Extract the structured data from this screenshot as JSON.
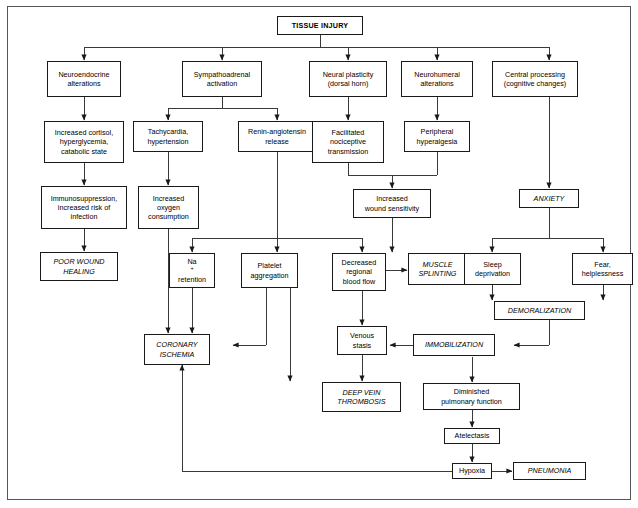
{
  "figure": {
    "type": "flowchart",
    "title": "TISSUE INJURY",
    "border_color": "#555555",
    "node_border_color": "#1a1a1a",
    "background": "#ffffff"
  },
  "nodes": {
    "tissue_injury": "TISSUE INJURY",
    "neuroendocrine_alterations": "Neuroendocrine\nalterations",
    "sympathoadrenal_activation": "Sympathoadrenal\nactivation",
    "neural_plasticity": "Neural plasticity\n(dorsal horn)",
    "neurohumeral_alterations": "Neurohumeral\nalterations",
    "central_processing": "Central processing\n(cognitive changes)",
    "increased_cortisol": "Increased cortisol,\nhyperglycemia,\ncatabolic state",
    "tachycardia": "Tachycardia,\nhypertension",
    "renin_angiotensin": "Renin-angiotensin\nrelease",
    "facilitated_nociceptive": "Facilitated\nnociceptive\ntransmission",
    "peripheral_hyperalgesia": "Peripheral\nhyperalgesia",
    "immunosuppression": "Immunosuppression,\nincreased risk of\ninfection",
    "increased_oxygen": "Increased\noxygen\nconsumption",
    "increased_wound_sensitivity": "Increased\nwound sensitivity",
    "anxiety": "ANXIETY",
    "poor_wound_healing": "POOR WOUND\nHEALING",
    "na_retention_line1": "Na",
    "na_retention_sup": "+",
    "na_retention_line2": "retention",
    "platelet_aggregation": "Platelet\naggregation",
    "decreased_regional_blood_flow": "Decreased\nregional\nblood flow",
    "muscle_splinting": "MUSCLE\nSPLINTING",
    "sleep_deprivation": "Sleep\ndeprivation",
    "fear_helplessness": "Fear,\nhelplessness",
    "demoralization": "DEMORALIZATION",
    "coronary_ischemia": "CORONARY\nISCHEMIA",
    "venous_stasis": "Venous\nstasis",
    "immobilization": "IMMOBILIZATION",
    "deep_vein_thrombosis": "DEEP VEIN\nTHROMBOSIS",
    "diminished_pulmonary_function": "Diminished\npulmonary function",
    "atelectasis": "Atelectasis",
    "hypoxia": "Hypoxia",
    "pneumonia": "PNEUMONIA"
  },
  "edges": [
    {
      "from": "tissue_injury",
      "to": "neuroendocrine_alterations"
    },
    {
      "from": "tissue_injury",
      "to": "sympathoadrenal_activation"
    },
    {
      "from": "tissue_injury",
      "to": "neural_plasticity"
    },
    {
      "from": "tissue_injury",
      "to": "neurohumeral_alterations"
    },
    {
      "from": "tissue_injury",
      "to": "central_processing"
    },
    {
      "from": "neuroendocrine_alterations",
      "to": "increased_cortisol"
    },
    {
      "from": "sympathoadrenal_activation",
      "to": "tachycardia"
    },
    {
      "from": "sympathoadrenal_activation",
      "to": "renin_angiotensin"
    },
    {
      "from": "neural_plasticity",
      "to": "facilitated_nociceptive"
    },
    {
      "from": "neurohumeral_alterations",
      "to": "peripheral_hyperalgesia"
    },
    {
      "from": "central_processing",
      "to": "anxiety"
    },
    {
      "from": "increased_cortisol",
      "to": "immunosuppression"
    },
    {
      "from": "tachycardia",
      "to": "increased_oxygen"
    },
    {
      "from": "facilitated_nociceptive",
      "to": "increased_wound_sensitivity"
    },
    {
      "from": "peripheral_hyperalgesia",
      "to": "increased_wound_sensitivity"
    },
    {
      "from": "immunosuppression",
      "to": "poor_wound_healing"
    },
    {
      "from": "increased_oxygen",
      "to": "coronary_ischemia"
    },
    {
      "from": "renin_angiotensin",
      "to": "na_retention"
    },
    {
      "from": "renin_angiotensin",
      "to": "platelet_aggregation"
    },
    {
      "from": "renin_angiotensin",
      "to": "decreased_regional_blood_flow"
    },
    {
      "from": "increased_wound_sensitivity",
      "to": "muscle_splinting"
    },
    {
      "from": "anxiety",
      "to": "sleep_deprivation"
    },
    {
      "from": "anxiety",
      "to": "fear_helplessness"
    },
    {
      "from": "na_retention",
      "to": "coronary_ischemia"
    },
    {
      "from": "platelet_aggregation",
      "to": "coronary_ischemia"
    },
    {
      "from": "platelet_aggregation",
      "to": "deep_vein_thrombosis"
    },
    {
      "from": "decreased_regional_blood_flow",
      "to": "muscle_splinting"
    },
    {
      "from": "decreased_regional_blood_flow",
      "to": "venous_stasis"
    },
    {
      "from": "sleep_deprivation",
      "to": "demoralization"
    },
    {
      "from": "fear_helplessness",
      "to": "demoralization"
    },
    {
      "from": "demoralization",
      "to": "immobilization"
    },
    {
      "from": "immobilization",
      "to": "venous_stasis"
    },
    {
      "from": "immobilization",
      "to": "diminished_pulmonary_function"
    },
    {
      "from": "venous_stasis",
      "to": "deep_vein_thrombosis"
    },
    {
      "from": "diminished_pulmonary_function",
      "to": "atelectasis"
    },
    {
      "from": "atelectasis",
      "to": "hypoxia"
    },
    {
      "from": "hypoxia",
      "to": "pneumonia"
    },
    {
      "from": "hypoxia",
      "to": "coronary_ischemia"
    }
  ]
}
